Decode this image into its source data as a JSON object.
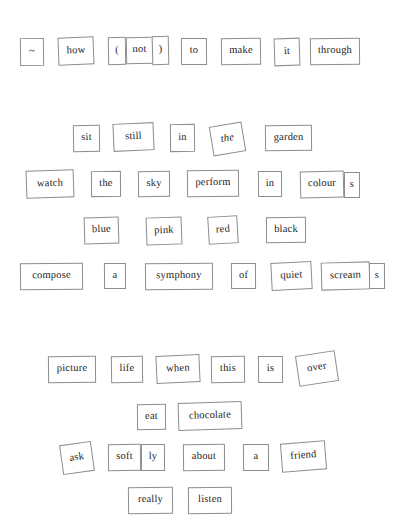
{
  "poem": {
    "title": "magnetic poetry board",
    "full_text": "~ how ( not ) to make it through / sit still in the garden / watch the sky perform in colours / blue pink red black / compose a symphony of quiet screams / picture life when this is over / eat chocolate / ask softly about a friend / really listen",
    "background_color": "#ffffff",
    "tile_border_color": "#8d8d8d",
    "tile_fill_color": "#ffffff",
    "text_color": "#1c1c1c"
  },
  "tiles": [
    {
      "id": "tilde",
      "text": "~",
      "x": 20,
      "y": 38,
      "w": 24,
      "h": 28,
      "rot": -0.6,
      "italic": false,
      "size": 10.5
    },
    {
      "id": "how",
      "text": "how",
      "x": 58,
      "y": 37,
      "w": 36,
      "h": 28,
      "rot": -2.2,
      "italic": false,
      "size": 10.5
    },
    {
      "id": "paren-open",
      "text": "(",
      "x": 108,
      "y": 37,
      "w": 18,
      "h": 28,
      "rot": -1.0,
      "italic": false,
      "size": 10.5
    },
    {
      "id": "not",
      "text": "not",
      "x": 126,
      "y": 37,
      "w": 27,
      "h": 27,
      "rot": -0.8,
      "italic": false,
      "size": 10.5
    },
    {
      "id": "paren-close",
      "text": ")",
      "x": 152,
      "y": 36,
      "w": 17,
      "h": 29,
      "rot": -1.2,
      "italic": false,
      "size": 10.5
    },
    {
      "id": "to",
      "text": "to",
      "x": 181,
      "y": 38,
      "w": 26,
      "h": 27,
      "rot": -0.4,
      "italic": false,
      "size": 10.5
    },
    {
      "id": "make",
      "text": "make",
      "x": 221,
      "y": 38,
      "w": 40,
      "h": 27,
      "rot": -0.6,
      "italic": false,
      "size": 10.5
    },
    {
      "id": "it",
      "text": "it",
      "x": 274,
      "y": 38,
      "w": 26,
      "h": 28,
      "rot": -1.8,
      "italic": false,
      "size": 10.5
    },
    {
      "id": "through",
      "text": "through",
      "x": 310,
      "y": 38,
      "w": 50,
      "h": 27,
      "rot": -0.5,
      "italic": false,
      "size": 10.5
    },
    {
      "id": "sit",
      "text": "sit",
      "x": 73,
      "y": 125,
      "w": 27,
      "h": 27,
      "rot": -0.8,
      "italic": false,
      "size": 10.5
    },
    {
      "id": "still",
      "text": "still",
      "x": 113,
      "y": 123,
      "w": 41,
      "h": 28,
      "rot": -2.5,
      "italic": false,
      "size": 10.5
    },
    {
      "id": "in-1",
      "text": "in",
      "x": 170,
      "y": 124,
      "w": 25,
      "h": 28,
      "rot": -0.6,
      "italic": false,
      "size": 10.5
    },
    {
      "id": "the-1",
      "text": "the",
      "x": 211,
      "y": 124,
      "w": 33,
      "h": 30,
      "rot": -9.5,
      "italic": true,
      "size": 10.5
    },
    {
      "id": "garden",
      "text": "garden",
      "x": 265,
      "y": 125,
      "w": 47,
      "h": 26,
      "rot": -0.5,
      "italic": false,
      "size": 10.5
    },
    {
      "id": "watch",
      "text": "watch",
      "x": 26,
      "y": 170,
      "w": 48,
      "h": 28,
      "rot": -2.0,
      "italic": false,
      "size": 10.5
    },
    {
      "id": "the-2",
      "text": "the",
      "x": 91,
      "y": 171,
      "w": 30,
      "h": 26,
      "rot": -0.5,
      "italic": false,
      "size": 10.5
    },
    {
      "id": "sky",
      "text": "sky",
      "x": 138,
      "y": 171,
      "w": 32,
      "h": 26,
      "rot": -0.6,
      "italic": false,
      "size": 10.5
    },
    {
      "id": "perform",
      "text": "perform",
      "x": 187,
      "y": 170,
      "w": 52,
      "h": 27,
      "rot": -0.6,
      "italic": false,
      "size": 10.5
    },
    {
      "id": "in-2",
      "text": "in",
      "x": 258,
      "y": 171,
      "w": 24,
      "h": 26,
      "rot": -0.5,
      "italic": false,
      "size": 10.5
    },
    {
      "id": "colour",
      "text": "colour",
      "x": 300,
      "y": 171,
      "w": 44,
      "h": 27,
      "rot": -1.4,
      "italic": false,
      "size": 10.5
    },
    {
      "id": "colour-s",
      "text": "s",
      "x": 344,
      "y": 172,
      "w": 16,
      "h": 26,
      "rot": -0.3,
      "italic": false,
      "size": 10.5
    },
    {
      "id": "blue",
      "text": "blue",
      "x": 84,
      "y": 217,
      "w": 35,
      "h": 27,
      "rot": -1.6,
      "italic": false,
      "size": 10.5
    },
    {
      "id": "pink",
      "text": "pink",
      "x": 146,
      "y": 217,
      "w": 36,
      "h": 28,
      "rot": -2.0,
      "italic": false,
      "size": 10.5
    },
    {
      "id": "red",
      "text": "red",
      "x": 208,
      "y": 216,
      "w": 30,
      "h": 28,
      "rot": -3.4,
      "italic": false,
      "size": 10.5
    },
    {
      "id": "black",
      "text": "black",
      "x": 266,
      "y": 217,
      "w": 40,
      "h": 26,
      "rot": -0.4,
      "italic": false,
      "size": 10.5
    },
    {
      "id": "compose",
      "text": "compose",
      "x": 20,
      "y": 263,
      "w": 63,
      "h": 27,
      "rot": -0.5,
      "italic": false,
      "size": 10.5
    },
    {
      "id": "a-1",
      "text": "a",
      "x": 104,
      "y": 263,
      "w": 22,
      "h": 26,
      "rot": -0.4,
      "italic": false,
      "size": 10.5
    },
    {
      "id": "symphony",
      "text": "symphony",
      "x": 145,
      "y": 263,
      "w": 68,
      "h": 27,
      "rot": -0.5,
      "italic": false,
      "size": 10.5
    },
    {
      "id": "of",
      "text": "of",
      "x": 231,
      "y": 263,
      "w": 25,
      "h": 26,
      "rot": -0.4,
      "italic": false,
      "size": 10.5
    },
    {
      "id": "quiet",
      "text": "quiet",
      "x": 271,
      "y": 262,
      "w": 41,
      "h": 28,
      "rot": -3.0,
      "italic": false,
      "size": 10.5
    },
    {
      "id": "scream",
      "text": "scream",
      "x": 321,
      "y": 262,
      "w": 49,
      "h": 28,
      "rot": -1.5,
      "italic": false,
      "size": 10.5
    },
    {
      "id": "scream-s",
      "text": "s",
      "x": 369,
      "y": 263,
      "w": 16,
      "h": 26,
      "rot": -0.3,
      "italic": false,
      "size": 10.5
    },
    {
      "id": "picture",
      "text": "picture",
      "x": 48,
      "y": 356,
      "w": 48,
      "h": 27,
      "rot": -0.5,
      "italic": false,
      "size": 10.5
    },
    {
      "id": "life",
      "text": "life",
      "x": 111,
      "y": 356,
      "w": 32,
      "h": 27,
      "rot": -0.8,
      "italic": false,
      "size": 10.5
    },
    {
      "id": "when",
      "text": "when",
      "x": 156,
      "y": 355,
      "w": 44,
      "h": 28,
      "rot": -2.6,
      "italic": false,
      "size": 10.5
    },
    {
      "id": "this",
      "text": "this",
      "x": 211,
      "y": 356,
      "w": 34,
      "h": 27,
      "rot": -0.6,
      "italic": false,
      "size": 10.5
    },
    {
      "id": "is",
      "text": "is",
      "x": 258,
      "y": 356,
      "w": 25,
      "h": 27,
      "rot": -0.5,
      "italic": false,
      "size": 10.5
    },
    {
      "id": "over",
      "text": "over",
      "x": 297,
      "y": 353,
      "w": 40,
      "h": 31,
      "rot": -8.5,
      "italic": false,
      "size": 10.5
    },
    {
      "id": "eat",
      "text": "eat",
      "x": 137,
      "y": 404,
      "w": 29,
      "h": 26,
      "rot": -0.6,
      "italic": false,
      "size": 10.5
    },
    {
      "id": "chocolate",
      "text": "chocolate",
      "x": 178,
      "y": 402,
      "w": 64,
      "h": 28,
      "rot": -1.8,
      "italic": false,
      "size": 10.5
    },
    {
      "id": "ask",
      "text": "ask",
      "x": 61,
      "y": 443,
      "w": 32,
      "h": 30,
      "rot": -8.0,
      "italic": false,
      "size": 10.5
    },
    {
      "id": "soft",
      "text": "soft",
      "x": 108,
      "y": 444,
      "w": 33,
      "h": 27,
      "rot": -0.5,
      "italic": false,
      "size": 10.5
    },
    {
      "id": "ly",
      "text": "ly",
      "x": 141,
      "y": 444,
      "w": 24,
      "h": 27,
      "rot": -0.4,
      "italic": false,
      "size": 10.5
    },
    {
      "id": "about",
      "text": "about",
      "x": 183,
      "y": 444,
      "w": 42,
      "h": 27,
      "rot": -0.5,
      "italic": false,
      "size": 10.5
    },
    {
      "id": "a-2",
      "text": "a",
      "x": 243,
      "y": 444,
      "w": 26,
      "h": 27,
      "rot": -0.4,
      "italic": false,
      "size": 10.5
    },
    {
      "id": "friend",
      "text": "friend",
      "x": 281,
      "y": 442,
      "w": 45,
      "h": 29,
      "rot": -4.5,
      "italic": false,
      "size": 10.5
    },
    {
      "id": "really",
      "text": "really",
      "x": 128,
      "y": 487,
      "w": 45,
      "h": 27,
      "rot": -0.5,
      "italic": false,
      "size": 10.5
    },
    {
      "id": "listen",
      "text": "listen",
      "x": 188,
      "y": 487,
      "w": 44,
      "h": 27,
      "rot": -0.4,
      "italic": false,
      "size": 10.5
    }
  ]
}
